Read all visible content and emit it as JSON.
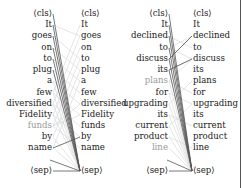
{
  "panels": [
    {
      "id": "left",
      "left_tokens": [
        "⟨cls⟩",
        "It",
        "goes",
        "on",
        "to",
        "plug",
        "a",
        "few",
        "diversified",
        "Fidelity",
        "funds",
        "by",
        "name",
        "",
        "⟨sep⟩"
      ],
      "right_tokens": [
        "⟨cls⟩",
        "It",
        "goes",
        "on",
        "to",
        "plug",
        "a",
        "few",
        "diversified",
        "Fidelity",
        "funds",
        "by",
        "name",
        "",
        "⟨sep⟩"
      ],
      "highlighted_left_index": 10
    },
    {
      "id": "right",
      "left_tokens": [
        "⟨cls⟩",
        "It",
        "declined",
        "to",
        "discuss",
        "its",
        "plans",
        "for",
        "upgrading",
        "its",
        "current",
        "product",
        "line",
        "",
        "⟨sep⟩"
      ],
      "right_tokens": [
        "⟨cls⟩",
        "It",
        "declined",
        "to",
        "discuss",
        "its",
        "plans",
        "for",
        "upgrading",
        "its",
        "current",
        "product",
        "line",
        "",
        "⟨sep⟩"
      ],
      "highlighted_left_index": [
        6,
        12
      ]
    }
  ],
  "colors": {
    "text": "#222222",
    "dim_text": "#9a9a9a",
    "strong_link": "#333333",
    "weak_link": "#cfcfcf"
  }
}
